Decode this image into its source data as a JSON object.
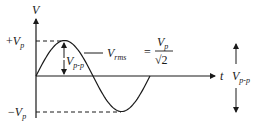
{
  "diagram": {
    "colors": {
      "ink": "#1a1a1a",
      "background": "#ffffff"
    },
    "axes": {
      "y_label": "V",
      "x_label": "t"
    },
    "levels": {
      "positive_peak": {
        "sign": "+",
        "symbol": "V",
        "subscript": "p"
      },
      "negative_peak": {
        "sign": "−",
        "symbol": "V",
        "subscript": "p"
      }
    },
    "annotations": {
      "amplitude_arrow": {
        "symbol": "V",
        "subscript": "p-p"
      },
      "rms": {
        "symbol": "V",
        "subscript": "rms",
        "equals": "=",
        "numerator_symbol": "V",
        "numerator_subscript": "p",
        "denominator": "√2"
      },
      "peak_to_peak": {
        "symbol": "V",
        "subscript": "p-p"
      }
    },
    "waveform": {
      "type": "sine",
      "cycles": 1,
      "amplitude": 1
    }
  }
}
